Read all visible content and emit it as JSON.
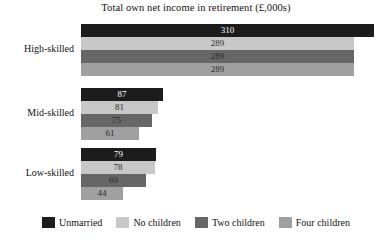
{
  "chart_data": {
    "type": "bar",
    "orientation": "horizontal",
    "title": "Total own net income in retirement (£,000s)",
    "xlabel": "",
    "ylabel": "",
    "categories": [
      "High-skilled",
      "Mid-skilled",
      "Low-skilled"
    ],
    "series": [
      {
        "name": "Unmarried",
        "color": "#1c1c1c",
        "values": [
          310,
          87,
          79
        ]
      },
      {
        "name": "No children",
        "color": "#c8c8c8",
        "values": [
          289,
          81,
          78
        ]
      },
      {
        "name": "Two children",
        "color": "#666666",
        "values": [
          289,
          75,
          69
        ]
      },
      {
        "name": "Four children",
        "color": "#a0a0a0",
        "values": [
          289,
          61,
          44
        ]
      }
    ],
    "xlim": [
      0,
      310
    ],
    "grid": false,
    "legend_position": "bottom",
    "value_labels": true
  },
  "legend": {
    "items": [
      {
        "label": "Unmarried",
        "color": "#1c1c1c"
      },
      {
        "label": "No children",
        "color": "#c8c8c8"
      },
      {
        "label": "Two children",
        "color": "#666666"
      },
      {
        "label": "Four children",
        "color": "#a0a0a0"
      }
    ]
  }
}
